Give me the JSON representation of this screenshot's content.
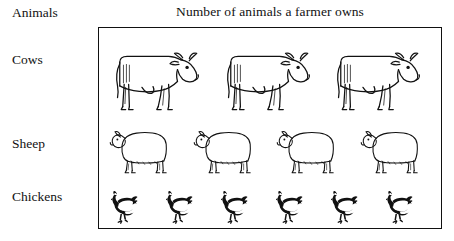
{
  "chart_data": {
    "type": "bar",
    "title": "Number of animals a farmer owns",
    "xlabel": "",
    "ylabel": "Animals",
    "categories": [
      "Cows",
      "Sheep",
      "Chickens"
    ],
    "values": [
      3,
      4,
      6
    ],
    "series": [
      {
        "name": "Number of animals",
        "values": [
          3,
          4,
          6
        ]
      }
    ],
    "grid": false,
    "legend": null,
    "rows": [
      {
        "label": "Cows",
        "count": 3,
        "icon": "cow-icon",
        "style": "outline"
      },
      {
        "label": "Sheep",
        "count": 4,
        "icon": "sheep-icon",
        "style": "outline"
      },
      {
        "label": "Chickens",
        "count": 6,
        "icon": "chicken-icon",
        "style": "filled"
      }
    ]
  },
  "chart": {
    "title": "Number of animals a farmer owns",
    "axis_header": "Animals",
    "labels": {
      "cows": "Cows",
      "sheep": "Sheep",
      "chickens": "Chickens"
    },
    "colors": {
      "ink": "#111111",
      "background": "#ffffff",
      "border": "#111111"
    }
  }
}
